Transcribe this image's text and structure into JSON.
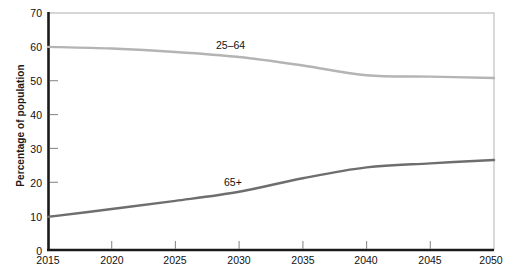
{
  "chart_data": {
    "type": "line",
    "title": "",
    "xlabel": "",
    "ylabel": "Percentage of population",
    "xlim": [
      2015,
      2050
    ],
    "ylim": [
      0,
      70
    ],
    "grid": false,
    "legend_position": "inline-annotation",
    "x": [
      2015,
      2020,
      2025,
      2030,
      2035,
      2040,
      2045,
      2050
    ],
    "xticks": [
      "2015",
      "2020",
      "2025",
      "2030",
      "2035",
      "2040",
      "2045",
      "2050"
    ],
    "yticks": [
      "0",
      "10",
      "20",
      "30",
      "40",
      "50",
      "60",
      "70"
    ],
    "series": [
      {
        "name": "25–64",
        "color": "#b4b4b4",
        "values": [
          60.0,
          59.5,
          58.5,
          57.0,
          54.5,
          51.6,
          51.2,
          50.8
        ],
        "annotation": "25–64"
      },
      {
        "name": "65+",
        "color": "#6e6e6e",
        "values": [
          9.8,
          12.1,
          14.5,
          17.2,
          21.2,
          24.4,
          25.6,
          26.6
        ],
        "annotation": "65+"
      }
    ]
  },
  "axes": {
    "y_title": "Percentage of population",
    "y_ticks": [
      {
        "label": "70",
        "value": 70
      },
      {
        "label": "60",
        "value": 60
      },
      {
        "label": "50",
        "value": 50
      },
      {
        "label": "40",
        "value": 40
      },
      {
        "label": "30",
        "value": 30
      },
      {
        "label": "20",
        "value": 20
      },
      {
        "label": "10",
        "value": 10
      },
      {
        "label": "0",
        "value": 0
      }
    ],
    "x_ticks": [
      {
        "label": "2015",
        "value": 2015
      },
      {
        "label": "2020",
        "value": 2020
      },
      {
        "label": "2025",
        "value": 2025
      },
      {
        "label": "2030",
        "value": 2030
      },
      {
        "label": "2035",
        "value": 2035
      },
      {
        "label": "2040",
        "value": 2040
      },
      {
        "label": "2045",
        "value": 2045
      },
      {
        "label": "2050",
        "value": 2050
      }
    ]
  },
  "annotations": {
    "series_2564": "25–64",
    "series_65plus": "65+"
  },
  "colors": {
    "axis": "#1a1a1a",
    "frame": "#c9c9c9",
    "tick": "#8c8c8c",
    "line_2564": "#b4b4b4",
    "line_65plus": "#6e6e6e",
    "background": "#ffffff",
    "text": "#111111"
  }
}
